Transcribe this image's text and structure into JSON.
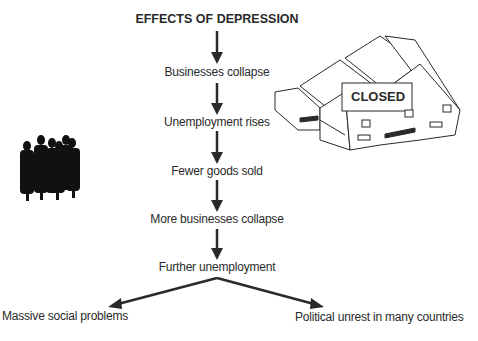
{
  "title": "EFFECTS OF DEPRESSION",
  "steps": [
    "Businesses collapse",
    "Unemployment rises",
    "Fewer goods sold",
    "More businesses collapse",
    "Further unemployment"
  ],
  "outcomes": {
    "left": "Massive social problems",
    "right": "Political unrest in many countries"
  },
  "building_sign": "CLOSED",
  "colors": {
    "ink": "#2a2a2a",
    "background": "#ffffff"
  }
}
